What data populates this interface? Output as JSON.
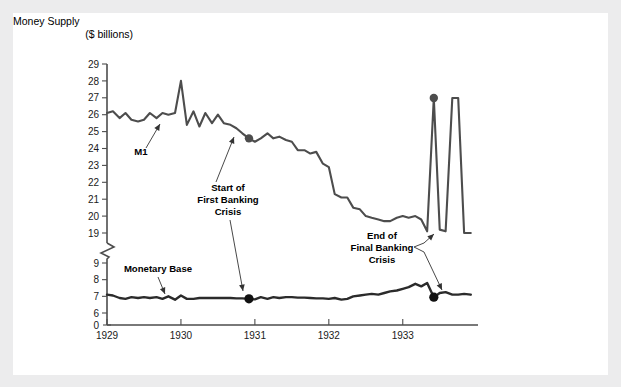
{
  "card": {
    "background": "#ffffff",
    "page_background": "#ececed"
  },
  "chart_data": {
    "type": "line",
    "title": "",
    "ylabel_line1": "Money Supply",
    "ylabel_line2": "($ billions)",
    "xlabel": "",
    "grid": false,
    "legend": "inline-labels",
    "axis_break": {
      "between": [
        19,
        9
      ],
      "label": "zigzag"
    },
    "yticks": [
      29,
      28,
      27,
      26,
      25,
      24,
      23,
      22,
      21,
      20,
      19,
      9,
      8,
      7,
      6,
      0
    ],
    "xticks": [
      "1929",
      "1930",
      "1931",
      "1932",
      "1933"
    ],
    "ylim_upper": [
      19,
      29
    ],
    "ylim_lower": [
      0,
      9
    ],
    "xlim": [
      1929.0,
      1933.95
    ],
    "line_color": "#4d4d4d",
    "series": [
      {
        "name": "M1",
        "label": "M1",
        "x": [
          1929.0,
          1929.08,
          1929.17,
          1929.25,
          1929.33,
          1929.42,
          1929.5,
          1929.58,
          1929.67,
          1929.75,
          1929.83,
          1929.92,
          1930.0,
          1930.08,
          1930.17,
          1930.25,
          1930.33,
          1930.42,
          1930.5,
          1930.58,
          1930.67,
          1930.75,
          1930.83,
          1930.92,
          1931.0,
          1931.08,
          1931.17,
          1931.25,
          1931.33,
          1931.42,
          1931.5,
          1931.58,
          1931.67,
          1931.75,
          1931.83,
          1931.92,
          1932.0,
          1932.08,
          1932.17,
          1932.25,
          1932.33,
          1932.42,
          1932.5,
          1932.58,
          1932.67,
          1932.75,
          1932.83,
          1932.92,
          1933.0,
          1933.08,
          1933.17,
          1933.25,
          1933.33,
          1933.42,
          1933.5,
          1933.58,
          1933.67,
          1933.75,
          1933.83,
          1933.92
        ],
        "values": [
          26.1,
          26.2,
          25.8,
          26.1,
          25.7,
          25.6,
          25.7,
          26.1,
          25.8,
          26.1,
          26.0,
          26.1,
          28.0,
          25.4,
          26.2,
          25.3,
          26.1,
          25.5,
          26.0,
          25.5,
          25.4,
          25.2,
          24.9,
          24.6,
          24.4,
          24.6,
          24.9,
          24.6,
          24.7,
          24.5,
          24.4,
          23.9,
          23.9,
          23.7,
          23.8,
          23.1,
          22.9,
          21.3,
          21.1,
          21.1,
          20.5,
          20.4,
          20.0,
          19.9,
          19.8,
          19.7,
          19.7,
          19.9,
          20.0,
          19.9,
          20.0,
          19.8,
          19.1,
          18.9,
          19.2,
          19.1,
          18.9,
          18.9,
          19.0,
          19.0
        ]
      },
      {
        "name": "Monetary Base",
        "label": "Monetary Base",
        "x": [
          1929.0,
          1929.08,
          1929.17,
          1929.25,
          1929.33,
          1929.42,
          1929.5,
          1929.58,
          1929.67,
          1929.75,
          1929.83,
          1929.92,
          1930.0,
          1930.08,
          1930.17,
          1930.25,
          1930.33,
          1930.42,
          1930.5,
          1930.58,
          1930.67,
          1930.75,
          1930.83,
          1930.92,
          1931.0,
          1931.08,
          1931.17,
          1931.25,
          1931.33,
          1931.42,
          1931.5,
          1931.58,
          1931.67,
          1931.75,
          1931.83,
          1931.92,
          1932.0,
          1932.08,
          1932.17,
          1932.25,
          1932.33,
          1932.42,
          1932.5,
          1932.58,
          1932.67,
          1932.75,
          1932.83,
          1932.92,
          1933.0,
          1933.08,
          1933.17,
          1933.25,
          1933.33,
          1933.42,
          1933.5,
          1933.58,
          1933.67,
          1933.75,
          1933.83,
          1933.92
        ],
        "values": [
          7.1,
          7.05,
          6.9,
          6.85,
          6.95,
          6.9,
          6.95,
          6.9,
          6.95,
          6.85,
          7.0,
          6.8,
          7.05,
          6.85,
          6.85,
          6.9,
          6.9,
          6.9,
          6.9,
          6.9,
          6.9,
          6.88,
          6.88,
          6.85,
          6.82,
          6.95,
          6.85,
          6.95,
          6.9,
          6.95,
          6.95,
          6.92,
          6.92,
          6.9,
          6.88,
          6.88,
          6.85,
          6.9,
          6.8,
          6.85,
          7.0,
          7.05,
          7.1,
          7.15,
          7.1,
          7.2,
          7.3,
          7.35,
          7.45,
          7.55,
          7.75,
          7.6,
          7.8,
          6.95,
          7.2,
          7.25,
          7.1,
          7.1,
          7.15,
          7.1
        ]
      }
    ],
    "markers": [
      {
        "series": "M1",
        "x": 1930.92,
        "y": 24.6,
        "note": "Start of First Banking Crisis"
      },
      {
        "series": "Monetary Base",
        "x": 1930.92,
        "y": 6.85,
        "note": "Start of First Banking Crisis"
      },
      {
        "series": "M1",
        "x": 1933.42,
        "y": 18.9,
        "note": "End of Final Banking Crisis"
      },
      {
        "series": "Monetary Base",
        "x": 1933.42,
        "y": 6.95,
        "note": "End of Final Banking Crisis"
      }
    ],
    "annotations": [
      {
        "id": "start-crisis",
        "lines": [
          "Start of",
          "First Banking",
          "Crisis"
        ]
      },
      {
        "id": "end-crisis",
        "lines": [
          "End of",
          "Final Banking",
          "Crisis"
        ]
      }
    ],
    "series_labels": [
      {
        "id": "m1-label",
        "text": "M1"
      },
      {
        "id": "monetary-base-label",
        "text": "Monetary Base"
      }
    ]
  }
}
